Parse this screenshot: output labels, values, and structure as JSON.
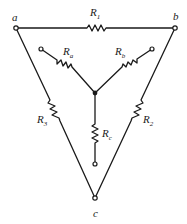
{
  "diagram": {
    "nodes": {
      "a": "a",
      "b": "b",
      "c": "c"
    },
    "resistors": {
      "R1": {
        "base": "R",
        "sub": "1"
      },
      "R2": {
        "base": "R",
        "sub": "2"
      },
      "R3": {
        "base": "R",
        "sub": "3"
      },
      "Ra": {
        "base": "R",
        "sub": "a"
      },
      "Rb": {
        "base": "R",
        "sub": "b"
      },
      "Rc": {
        "base": "R",
        "sub": "c"
      }
    },
    "colors": {
      "stroke": "#1a1a1a",
      "background": "#ffffff"
    }
  }
}
